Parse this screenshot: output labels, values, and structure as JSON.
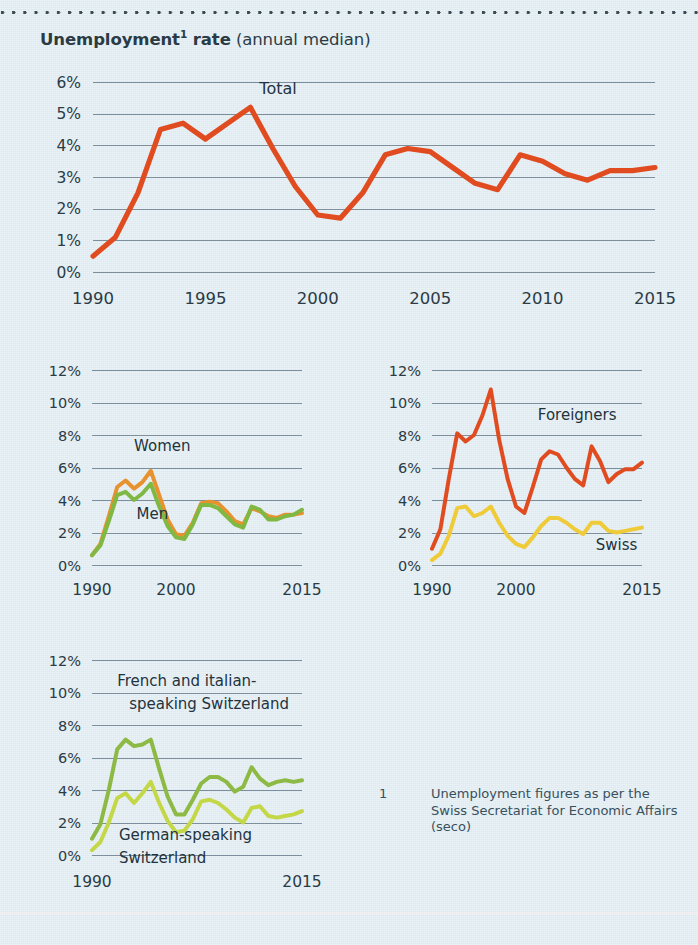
{
  "title": {
    "bold_main": "Unemployment",
    "superscript": "1",
    "bold_tail": " rate",
    "parenthetical": " (annual median)"
  },
  "footnote": {
    "marker": "1",
    "text": "Unemployment figures as per the Swiss Secretariat for Economic Affairs (seco)"
  },
  "colors": {
    "background": "#dce9f1",
    "gridline": "#7d8f9c",
    "text": "#2b3b45",
    "total_red": "#e04c20",
    "women_orange": "#e8922f",
    "men_green": "#7fb944",
    "foreigners_red": "#e04c20",
    "swiss_yellow": "#efca39",
    "french_italian_green": "#8cba45",
    "german_green": "#c4d747"
  },
  "chart_data": [
    {
      "id": "total",
      "type": "line",
      "title": "Unemployment rate (annual median)",
      "xlabel": "",
      "ylabel": "",
      "xlim": [
        1990,
        2015
      ],
      "ylim": [
        0,
        6
      ],
      "grid": true,
      "legend_position": "inline",
      "yticks": [
        "0%",
        "1%",
        "2%",
        "3%",
        "4%",
        "5%",
        "6%"
      ],
      "ytick_values": [
        0,
        1,
        2,
        3,
        4,
        5,
        6
      ],
      "xticks": [
        "1990",
        "1995",
        "2000",
        "2005",
        "2010",
        "2015"
      ],
      "xtick_values": [
        1990,
        1995,
        2000,
        2005,
        2010,
        2015
      ],
      "x": [
        1990,
        1991,
        1992,
        1993,
        1994,
        1995,
        1996,
        1997,
        1998,
        1999,
        2000,
        2001,
        2002,
        2003,
        2004,
        2005,
        2006,
        2007,
        2008,
        2009,
        2010,
        2011,
        2012,
        2013,
        2014,
        2015
      ],
      "series": [
        {
          "name": "Total",
          "color": "#e04c20",
          "label_x": 1997.4,
          "label_y": 5.62,
          "values": [
            0.5,
            1.1,
            2.5,
            4.5,
            4.7,
            4.2,
            4.7,
            5.2,
            3.9,
            2.7,
            1.8,
            1.7,
            2.5,
            3.7,
            3.9,
            3.8,
            3.3,
            2.8,
            2.6,
            3.7,
            3.5,
            3.1,
            2.9,
            3.2,
            3.2,
            3.3
          ]
        }
      ]
    },
    {
      "id": "gender",
      "type": "line",
      "title": "",
      "xlim": [
        1990,
        2015
      ],
      "ylim": [
        0,
        12
      ],
      "grid": true,
      "yticks": [
        "0%",
        "2%",
        "4%",
        "6%",
        "8%",
        "10%",
        "12%"
      ],
      "ytick_values": [
        0,
        2,
        4,
        6,
        8,
        10,
        12
      ],
      "xticks": [
        "1990",
        "2000",
        "2015"
      ],
      "xtick_values": [
        1990,
        2000,
        2015
      ],
      "x": [
        1990,
        1991,
        1992,
        1993,
        1994,
        1995,
        1996,
        1997,
        1998,
        1999,
        2000,
        2001,
        2002,
        2003,
        2004,
        2005,
        2006,
        2007,
        2008,
        2009,
        2010,
        2011,
        2012,
        2013,
        2014,
        2015
      ],
      "series": [
        {
          "name": "Women",
          "color": "#e8922f",
          "label_x": 1995.0,
          "label_y": 7.0,
          "values": [
            0.6,
            1.3,
            3.0,
            4.8,
            5.2,
            4.7,
            5.1,
            5.8,
            4.3,
            2.8,
            1.9,
            1.8,
            2.6,
            3.8,
            3.9,
            3.8,
            3.3,
            2.7,
            2.5,
            3.5,
            3.3,
            3.0,
            2.9,
            3.1,
            3.1,
            3.2
          ]
        },
        {
          "name": "Men",
          "color": "#7fb944",
          "label_x": 1995.3,
          "label_y": 2.85,
          "values": [
            0.6,
            1.2,
            2.7,
            4.3,
            4.5,
            4.0,
            4.4,
            5.0,
            3.6,
            2.4,
            1.7,
            1.6,
            2.5,
            3.7,
            3.7,
            3.5,
            3.0,
            2.5,
            2.3,
            3.6,
            3.4,
            2.8,
            2.8,
            3.0,
            3.1,
            3.4
          ]
        }
      ]
    },
    {
      "id": "nationality",
      "type": "line",
      "title": "",
      "xlim": [
        1990,
        2015
      ],
      "ylim": [
        0,
        12
      ],
      "grid": true,
      "yticks": [
        "0%",
        "2%",
        "4%",
        "6%",
        "8%",
        "10%",
        "12%"
      ],
      "ytick_values": [
        0,
        2,
        4,
        6,
        8,
        10,
        12
      ],
      "xticks": [
        "1990",
        "2000",
        "2015"
      ],
      "xtick_values": [
        1990,
        2000,
        2015
      ],
      "x": [
        1990,
        1991,
        1992,
        1993,
        1994,
        1995,
        1996,
        1997,
        1998,
        1999,
        2000,
        2001,
        2002,
        2003,
        2004,
        2005,
        2006,
        2007,
        2008,
        2009,
        2010,
        2011,
        2012,
        2013,
        2014,
        2015
      ],
      "series": [
        {
          "name": "Foreigners",
          "color": "#e04c20",
          "label_x": 2002.6,
          "label_y": 8.9,
          "values": [
            1.0,
            2.2,
            5.3,
            8.1,
            7.6,
            8.0,
            9.2,
            10.8,
            7.7,
            5.3,
            3.6,
            3.2,
            4.8,
            6.5,
            7.0,
            6.8,
            6.0,
            5.3,
            4.9,
            7.3,
            6.4,
            5.1,
            5.6,
            5.9,
            5.9,
            6.3
          ]
        },
        {
          "name": "Swiss",
          "color": "#efca39",
          "label_x": 2009.5,
          "label_y": 0.95,
          "values": [
            0.3,
            0.7,
            1.8,
            3.5,
            3.6,
            3.0,
            3.2,
            3.6,
            2.6,
            1.8,
            1.3,
            1.1,
            1.7,
            2.4,
            2.9,
            2.9,
            2.6,
            2.2,
            1.9,
            2.6,
            2.6,
            2.1,
            2.0,
            2.1,
            2.2,
            2.3
          ]
        }
      ]
    },
    {
      "id": "language-region",
      "type": "line",
      "title": "",
      "xlim": [
        1990,
        2015
      ],
      "ylim": [
        0,
        12
      ],
      "grid": true,
      "yticks": [
        "0%",
        "2%",
        "4%",
        "6%",
        "8%",
        "10%",
        "12%"
      ],
      "ytick_values": [
        0,
        2,
        4,
        6,
        8,
        10,
        12
      ],
      "xticks": [
        "1990",
        "2015"
      ],
      "xtick_values": [
        1990,
        2015
      ],
      "x": [
        1990,
        1991,
        1992,
        1993,
        1994,
        1995,
        1996,
        1997,
        1998,
        1999,
        2000,
        2001,
        2002,
        2003,
        2004,
        2005,
        2006,
        2007,
        2008,
        2009,
        2010,
        2011,
        2012,
        2013,
        2014,
        2015
      ],
      "series": [
        {
          "name": "French and italian-speaking Switzerland",
          "label_line1": "French and italian-",
          "label_line2": "speaking Switzerland",
          "color": "#8cba45",
          "label_x": 1993.0,
          "label_y": 10.4,
          "values": [
            1.0,
            1.9,
            4.0,
            6.5,
            7.1,
            6.7,
            6.8,
            7.1,
            5.3,
            3.6,
            2.5,
            2.5,
            3.4,
            4.4,
            4.8,
            4.8,
            4.5,
            3.9,
            4.2,
            5.4,
            4.7,
            4.3,
            4.5,
            4.6,
            4.5,
            4.6
          ]
        },
        {
          "name": "German-speaking Switzerland",
          "label_line1": "German-speaking",
          "label_line2": "Switzerland",
          "color": "#c4d747",
          "label_x": 1993.2,
          "label_y": 0.95,
          "values": [
            0.3,
            0.8,
            2.0,
            3.5,
            3.8,
            3.2,
            3.8,
            4.5,
            3.2,
            2.1,
            1.4,
            1.5,
            2.2,
            3.3,
            3.4,
            3.2,
            2.8,
            2.3,
            2.0,
            2.9,
            3.0,
            2.4,
            2.3,
            2.4,
            2.5,
            2.7
          ]
        }
      ]
    }
  ]
}
